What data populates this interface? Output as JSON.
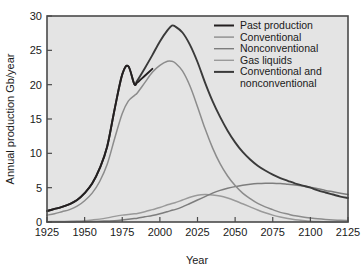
{
  "chart_data": {
    "type": "line",
    "title": "",
    "xlabel": "Year",
    "ylabel": "Annual production Gb/year",
    "xlim": [
      1925,
      2125
    ],
    "ylim": [
      0,
      30
    ],
    "xticks": [
      1925,
      1950,
      1975,
      2000,
      2025,
      2050,
      2075,
      2100,
      2125
    ],
    "yticks": [
      0,
      5,
      10,
      15,
      20,
      25,
      30
    ],
    "grid": false,
    "legend_position": "top-right",
    "x": [
      1925,
      1930,
      1935,
      1940,
      1945,
      1950,
      1955,
      1960,
      1965,
      1970,
      1975,
      1979,
      1983,
      1985,
      1990,
      1995,
      2000,
      2005,
      2008,
      2010,
      2015,
      2020,
      2025,
      2030,
      2035,
      2040,
      2045,
      2050,
      2055,
      2060,
      2065,
      2070,
      2075,
      2080,
      2085,
      2090,
      2095,
      2100,
      2105,
      2110,
      2115,
      2120,
      2125
    ],
    "series": [
      {
        "name": "Past production",
        "color": "#231f20",
        "width": 1.9,
        "values": [
          1.6,
          1.9,
          2.2,
          2.6,
          3.2,
          4.2,
          5.6,
          7.8,
          11.0,
          16.5,
          21.5,
          22.7,
          20.1,
          20.3,
          21.3,
          22.3,
          null,
          null,
          null,
          null,
          null,
          null,
          null,
          null,
          null,
          null,
          null,
          null,
          null,
          null,
          null,
          null,
          null,
          null,
          null,
          null,
          null,
          null,
          null,
          null,
          null,
          null,
          null
        ]
      },
      {
        "name": "Conventional",
        "color": "#8c8c8c",
        "width": 1.5,
        "values": [
          1.0,
          1.2,
          1.5,
          1.8,
          2.3,
          3.1,
          4.2,
          5.9,
          8.4,
          12.2,
          15.8,
          17.6,
          18.4,
          18.8,
          20.3,
          21.8,
          22.8,
          23.4,
          23.4,
          23.2,
          22.0,
          19.8,
          16.8,
          13.6,
          10.8,
          8.5,
          6.7,
          5.3,
          4.2,
          3.4,
          2.7,
          2.2,
          1.8,
          1.4,
          1.15,
          0.9,
          0.72,
          0.58,
          0.46,
          0.37,
          0.3,
          0.24,
          0.2
        ]
      },
      {
        "name": "Nonconventional",
        "color": "#7d7d7d",
        "width": 1.5,
        "values": [
          0.0,
          0.0,
          0.0,
          0.0,
          0.02,
          0.04,
          0.06,
          0.1,
          0.15,
          0.2,
          0.3,
          0.4,
          0.5,
          0.55,
          0.75,
          0.95,
          1.2,
          1.5,
          1.7,
          1.8,
          2.2,
          2.7,
          3.2,
          3.7,
          4.2,
          4.6,
          4.9,
          5.15,
          5.35,
          5.5,
          5.6,
          5.65,
          5.65,
          5.6,
          5.5,
          5.4,
          5.25,
          5.05,
          4.85,
          4.6,
          4.4,
          4.2,
          4.0
        ]
      },
      {
        "name": "Gas liquids",
        "color": "#9a9a9a",
        "width": 1.5,
        "values": [
          0.05,
          0.06,
          0.08,
          0.1,
          0.14,
          0.2,
          0.3,
          0.42,
          0.6,
          0.82,
          1.0,
          1.1,
          1.2,
          1.25,
          1.5,
          1.8,
          2.1,
          2.5,
          2.7,
          2.8,
          3.2,
          3.6,
          3.9,
          4.0,
          3.95,
          3.8,
          3.5,
          3.1,
          2.65,
          2.2,
          1.75,
          1.35,
          1.0,
          0.72,
          0.5,
          0.34,
          0.22,
          0.12,
          0.06,
          0.03,
          0.01,
          0.0,
          0.0
        ]
      },
      {
        "name": "Conventional and nonconventional",
        "color": "#3a3a3a",
        "width": 1.9,
        "values": [
          1.6,
          1.9,
          2.2,
          2.6,
          3.2,
          4.2,
          5.6,
          7.8,
          11.0,
          16.5,
          21.5,
          22.7,
          20.1,
          20.6,
          22.4,
          24.3,
          26.3,
          27.9,
          28.6,
          28.5,
          27.6,
          25.8,
          23.3,
          20.3,
          17.6,
          15.3,
          13.3,
          11.6,
          10.2,
          9.1,
          8.2,
          7.5,
          6.9,
          6.4,
          6.0,
          5.6,
          5.3,
          5.0,
          4.6,
          4.3,
          4.0,
          3.7,
          3.5
        ]
      }
    ],
    "legend": [
      {
        "label": "Past production",
        "color": "#231f20"
      },
      {
        "label": "Conventional",
        "color": "#8c8c8c"
      },
      {
        "label": "Nonconventional",
        "color": "#7d7d7d"
      },
      {
        "label": "Gas liquids",
        "color": "#9a9a9a"
      },
      {
        "label": "Conventional and",
        "color": "#3a3a3a"
      },
      {
        "label": "nonconventional",
        "color": null
      }
    ]
  },
  "style": {
    "plot_background": "#e4e4e4",
    "frame_color": "#4a4a4a",
    "page_background": "#ffffff",
    "text_color": "#1a1a1a"
  }
}
